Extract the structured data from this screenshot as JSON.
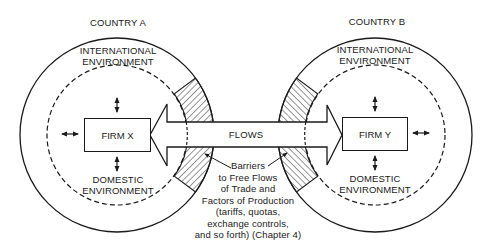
{
  "country_a": {
    "title": "COUNTRY A",
    "outer_label": "INTERNATIONAL\nENVIRONMENT",
    "inner_label": "DOMESTIC\nENVIRONMENT",
    "firm": "FIRM X"
  },
  "country_b": {
    "title": "COUNTRY B",
    "outer_label": "INTERNATIONAL\nENVIRONMENT",
    "inner_label": "DOMESTIC\nENVIRONMENT",
    "firm": "FIRM Y"
  },
  "flows": {
    "label": "FLOWS"
  },
  "barriers": {
    "label": "Barriers\nto Free Flows\nof Trade and\nFactors of Production\n(tariffs, quotas,\nexchange controls,\nand so forth) (Chapter 4)"
  },
  "colors": {
    "ink": "#1a1a1a",
    "background": "#ffffff"
  }
}
